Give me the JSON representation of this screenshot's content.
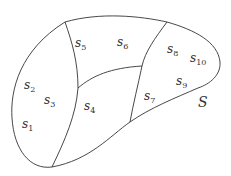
{
  "diagram": {
    "stroke_color": "#333333",
    "set_label": "S",
    "regions": [
      {
        "name": "s",
        "sub": "1",
        "x": 22,
        "y": 118
      },
      {
        "name": "s",
        "sub": "2",
        "x": 24,
        "y": 79
      },
      {
        "name": "s",
        "sub": "3",
        "x": 44,
        "y": 94
      },
      {
        "name": "s",
        "sub": "4",
        "x": 84,
        "y": 100
      },
      {
        "name": "s",
        "sub": "5",
        "x": 75,
        "y": 37
      },
      {
        "name": "s",
        "sub": "6",
        "x": 117,
        "y": 36
      },
      {
        "name": "s",
        "sub": "7",
        "x": 144,
        "y": 90
      },
      {
        "name": "s",
        "sub": "8",
        "x": 167,
        "y": 43
      },
      {
        "name": "s",
        "sub": "9",
        "x": 176,
        "y": 75
      },
      {
        "name": "s",
        "sub": "10",
        "x": 190,
        "y": 52
      }
    ]
  }
}
